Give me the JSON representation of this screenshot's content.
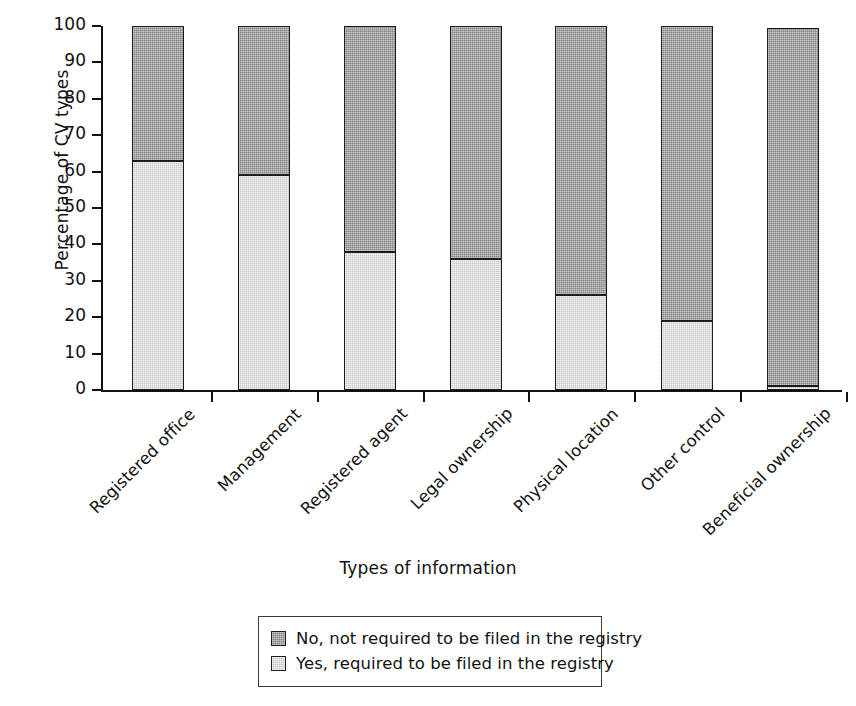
{
  "chart_data": {
    "type": "bar",
    "subtype": "stacked-bar-100",
    "title": "",
    "xlabel": "Types of information",
    "ylabel": "Percentage of CV types",
    "ylim": [
      0,
      100
    ],
    "ytick_labels": [
      "0",
      "10",
      "20",
      "30",
      "40",
      "50",
      "60",
      "70",
      "80",
      "90",
      "100"
    ],
    "ytick_values": [
      0,
      10,
      20,
      30,
      40,
      50,
      60,
      70,
      80,
      90,
      100
    ],
    "grid": false,
    "legend_position": "bottom-center",
    "categories": [
      "Registered office",
      "Management",
      "Registered agent",
      "Legal ownership",
      "Physical location",
      "Other control",
      "Beneficial ownership"
    ],
    "series": [
      {
        "name": "Yes, required to be filed in the registry",
        "color": "#c9c9c9",
        "values": [
          63,
          59,
          38,
          36,
          26,
          19,
          1
        ]
      },
      {
        "name": "No, not required to be filed in the registry",
        "color": "#818181",
        "values": [
          37,
          41,
          62,
          64,
          74,
          81,
          98.5
        ]
      }
    ],
    "stack_order": [
      "Yes, required to be filed in the registry",
      "No, not required to be filed in the registry"
    ]
  },
  "legend": {
    "items": [
      {
        "label": "No, not required to be filed in the registry",
        "color": "#818181"
      },
      {
        "label": "Yes, required to be filed in the registry",
        "color": "#c9c9c9"
      }
    ]
  }
}
